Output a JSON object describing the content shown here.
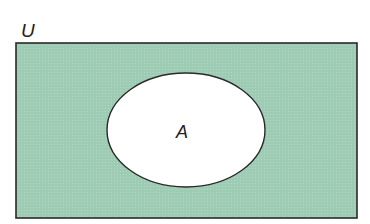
{
  "diagram": {
    "type": "venn",
    "universe": {
      "label": "U",
      "fill": "#9ecbb4",
      "stroke": "#2a2a2a"
    },
    "sets": [
      {
        "label": "A",
        "fill": "#ffffff",
        "stroke": "#2a2a2a"
      }
    ],
    "shaded_region": "complement of A (U \\ A)"
  }
}
